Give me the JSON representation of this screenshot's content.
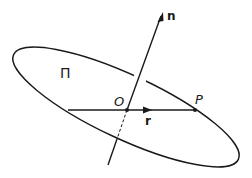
{
  "diagram": {
    "plane_label": "Π",
    "normal_label": "n",
    "origin_label": "O",
    "point_label": "P",
    "vector_label": "r",
    "colors": {
      "stroke": "#1a1a1a",
      "background": "#ffffff"
    }
  }
}
